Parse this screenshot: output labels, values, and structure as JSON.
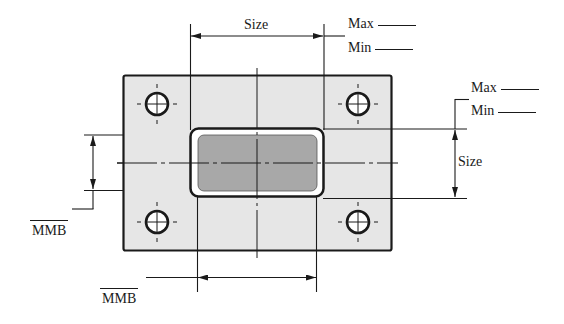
{
  "figure": {
    "title": "",
    "colors": {
      "plate_fill": "#e6e6e6",
      "cutout_fill": "#a8a8a8",
      "line": "#1a1a1a",
      "background": "#ffffff"
    },
    "dimensions": {
      "top": {
        "label": "Size",
        "max_label": "Max",
        "min_label": "Min"
      },
      "right": {
        "label": "Size",
        "max_label": "Max",
        "min_label": "Min"
      },
      "left": {
        "label": "MMB"
      },
      "bottom": {
        "label": "MMB"
      }
    },
    "holes": [
      {
        "name": "top-left",
        "symbol": "circle-crosshair"
      },
      {
        "name": "top-right",
        "symbol": "circle-crosshair"
      },
      {
        "name": "bottom-left",
        "symbol": "circle-crosshair"
      },
      {
        "name": "bottom-right",
        "symbol": "circle-crosshair"
      }
    ]
  }
}
